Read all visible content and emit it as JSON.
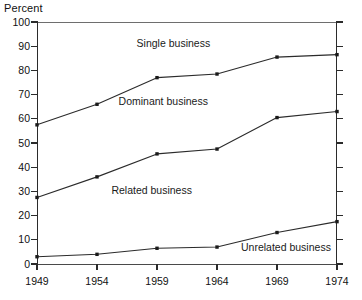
{
  "chart_data": {
    "type": "line",
    "title": "",
    "ylabel": "Percent",
    "xlabel": "",
    "x": [
      1949,
      1954,
      1959,
      1964,
      1969,
      1974
    ],
    "xtick_labels": [
      "1949",
      "1954",
      "1959",
      "1964",
      "1969",
      "1974"
    ],
    "ytick_labels": [
      "0",
      "10",
      "20",
      "30",
      "40",
      "50",
      "60",
      "70",
      "80",
      "90",
      "100"
    ],
    "yticks": [
      0,
      10,
      20,
      30,
      40,
      50,
      60,
      70,
      80,
      90,
      100
    ],
    "ylim": [
      0,
      100
    ],
    "grid": false,
    "legend_position": "inline-annotations",
    "marker": "square",
    "line_color": "#2b2b2b",
    "series": [
      {
        "name": "Single business",
        "label": "Single business",
        "values": [
          57.5,
          66,
          77,
          78.5,
          85.5,
          86.5
        ]
      },
      {
        "name": "Dominant business",
        "label": "Dominant business",
        "values": [
          27.5,
          36,
          45.5,
          47.5,
          60.5,
          63
        ]
      },
      {
        "name": "Related business",
        "label": "Related business",
        "values": [
          3,
          4,
          6.5,
          7,
          13,
          17.5
        ]
      }
    ],
    "annotations": [
      {
        "text": "Single business",
        "x": 1957.3,
        "y": 91
      },
      {
        "text": "Dominant business",
        "x": 1955.8,
        "y": 67
      },
      {
        "text": "Related business",
        "x": 1955.2,
        "y": 30
      },
      {
        "text": "Unrelated business",
        "x": 1966.0,
        "y": 6.5
      }
    ]
  }
}
